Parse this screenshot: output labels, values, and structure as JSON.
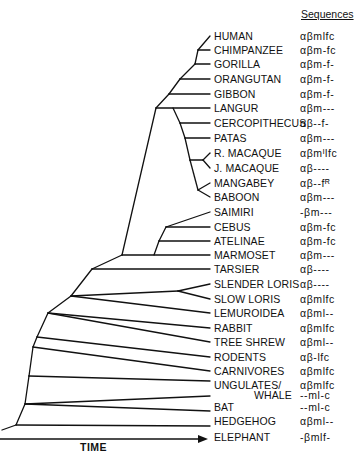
{
  "header": {
    "sequences_label": "Sequences"
  },
  "axis": {
    "label": "TIME",
    "direction": "left-to-right arrow"
  },
  "taxa": [
    {
      "name": "HUMAN",
      "seq": "αβmlfc",
      "y": 36
    },
    {
      "name": "CHIMPANZEE",
      "seq": "αβm-fc",
      "y": 50
    },
    {
      "name": "GORILLA",
      "seq": "αβm-f-",
      "y": 64
    },
    {
      "name": "ORANGUTAN",
      "seq": "αβm-f-",
      "y": 79
    },
    {
      "name": "GIBBON",
      "seq": "αβm-f-",
      "y": 94
    },
    {
      "name": "LANGUR",
      "seq": "αβm---",
      "y": 108
    },
    {
      "name": "CERCOPITHECUS",
      "seq": "αβ--f-",
      "y": 123
    },
    {
      "name": "PATAS",
      "seq": "αβm---",
      "y": 138
    },
    {
      "name": "R. MACAQUE",
      "seq": "αβmᴵlfc",
      "y": 153
    },
    {
      "name": "J. MACAQUE",
      "seq": "αβ----",
      "y": 168
    },
    {
      "name": "MANGABEY",
      "seq": "αβ--fᴿ",
      "y": 183
    },
    {
      "name": "BABOON",
      "seq": "αβm---",
      "y": 197
    },
    {
      "name": "SAIMIRI",
      "seq": "-βm---",
      "y": 212
    },
    {
      "name": "CEBUS",
      "seq": "αβm-fc",
      "y": 227
    },
    {
      "name": "ATELINAE",
      "seq": "αβm-fc",
      "y": 241
    },
    {
      "name": "MARMOSET",
      "seq": "αβm---",
      "y": 255
    },
    {
      "name": "TARSIER",
      "seq": "αβ----",
      "y": 269
    },
    {
      "name": "SLENDER LORIS",
      "seq": "αβ----",
      "y": 284
    },
    {
      "name": "SLOW LORIS",
      "seq": "αβmlfc",
      "y": 299
    },
    {
      "name": "LEMUROIDEA",
      "seq": "αβml--",
      "y": 313
    },
    {
      "name": "RABBIT",
      "seq": "αβmlfc",
      "y": 328
    },
    {
      "name": "TREE SHREW",
      "seq": "αβml--",
      "y": 342
    },
    {
      "name": "RODENTS",
      "seq": "αβ-lfc",
      "y": 357
    },
    {
      "name": "CARNIVORES",
      "seq": "αβmlfc",
      "y": 371
    },
    {
      "name": "UNGULATES/",
      "seq": "αβmlfc",
      "y": 385
    },
    {
      "name": "WHALE",
      "seq": "--ml-c",
      "y": 395,
      "indent": true
    },
    {
      "name": "BAT",
      "seq": "--ml-c",
      "y": 407
    },
    {
      "name": "HEDGEHOG",
      "seq": "αβml--",
      "y": 421
    },
    {
      "name": "ELEPHANT",
      "seq": "-βmlf-",
      "y": 437
    }
  ]
}
